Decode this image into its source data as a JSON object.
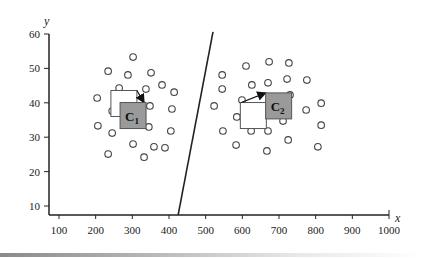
{
  "chart_data": {
    "type": "scatter",
    "title": "",
    "xlabel": "x",
    "ylabel": "y",
    "xlim": [
      75,
      1000
    ],
    "ylim": [
      5,
      60
    ],
    "x_ticks": [
      100,
      200,
      300,
      400,
      500,
      600,
      700,
      800,
      900,
      1000
    ],
    "y_ticks": [
      10,
      20,
      30,
      40,
      50,
      60
    ],
    "grid": false,
    "legend": "none",
    "series": [
      {
        "name": "cluster-1-points",
        "marker": "open-circle",
        "points": [
          [
            302,
            53.3
          ],
          [
            234,
            49.2
          ],
          [
            288,
            48.1
          ],
          [
            351,
            48.7
          ],
          [
            264,
            44.3
          ],
          [
            337,
            44.0
          ],
          [
            381,
            45.2
          ],
          [
            414,
            43.1
          ],
          [
            204,
            41.4
          ],
          [
            291,
            40.5
          ],
          [
            348,
            39.1
          ],
          [
            408,
            38.2
          ],
          [
            245,
            37.6
          ],
          [
            206,
            33.3
          ],
          [
            245,
            31.2
          ],
          [
            345,
            33.0
          ],
          [
            405,
            31.8
          ],
          [
            302,
            28.0
          ],
          [
            359,
            27.2
          ],
          [
            389,
            26.9
          ],
          [
            234,
            25.1
          ],
          [
            332,
            24.2
          ]
        ]
      },
      {
        "name": "cluster-2-points",
        "marker": "open-circle",
        "points": [
          [
            610,
            50.7
          ],
          [
            673,
            51.9
          ],
          [
            727,
            51.6
          ],
          [
            545,
            48.1
          ],
          [
            626,
            45.2
          ],
          [
            670,
            45.8
          ],
          [
            722,
            46.9
          ],
          [
            776,
            46.6
          ],
          [
            545,
            44.0
          ],
          [
            599,
            40.8
          ],
          [
            730,
            42.3
          ],
          [
            523,
            39.1
          ],
          [
            815,
            39.9
          ],
          [
            774,
            37.9
          ],
          [
            585,
            35.9
          ],
          [
            711,
            34.7
          ],
          [
            815,
            33.5
          ],
          [
            547,
            31.8
          ],
          [
            624,
            31.8
          ],
          [
            670,
            31.8
          ],
          [
            725,
            29.2
          ],
          [
            583,
            27.7
          ],
          [
            667,
            26.0
          ],
          [
            806,
            27.2
          ]
        ]
      }
    ],
    "centroids": [
      {
        "label": "C",
        "subscript": "1",
        "previous": [
          277,
          39.8
        ],
        "current": [
          302,
          36.3
        ],
        "fill": "#9a9a9a"
      },
      {
        "label": "C",
        "subscript": "2",
        "previous": [
          630,
          36.3
        ],
        "current": [
          699,
          39.1
        ],
        "fill": "#9a9a9a"
      }
    ],
    "decision_boundary": {
      "from": [
        425,
        7.4
      ],
      "to": [
        520,
        60.6
      ]
    }
  }
}
